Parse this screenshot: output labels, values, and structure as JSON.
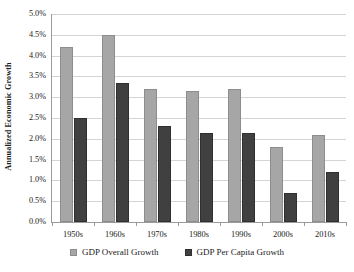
{
  "chart_data": {
    "type": "bar",
    "title": "",
    "xlabel": "",
    "ylabel": "Annualized Economic Growth",
    "ylim": [
      0,
      5
    ],
    "ytick_labels": [
      "5.0%",
      "4.5%",
      "4.0%",
      "3.5%",
      "3.0%",
      "2.5%",
      "2.0%",
      "1.5%",
      "1.0%",
      "0.5%",
      "0.0%"
    ],
    "ytick_values": [
      5.0,
      4.5,
      4.0,
      3.5,
      3.0,
      2.5,
      2.0,
      1.5,
      1.0,
      0.5,
      0.0
    ],
    "grid": true,
    "legend_position": "bottom",
    "categories": [
      "1950s",
      "1960s",
      "1970s",
      "1980s",
      "1990s",
      "2000s",
      "2010s"
    ],
    "series": [
      {
        "name": "GDP Overall Growth",
        "color": "#a6a6a6",
        "values": [
          4.2,
          4.5,
          3.2,
          3.15,
          3.2,
          1.8,
          2.1
        ]
      },
      {
        "name": "GDP Per Capita Growth",
        "color": "#404040",
        "values": [
          2.5,
          3.35,
          2.3,
          2.15,
          2.15,
          0.7,
          1.2
        ]
      }
    ]
  },
  "axis": {
    "y_title": "Annualized Economic Growth"
  }
}
